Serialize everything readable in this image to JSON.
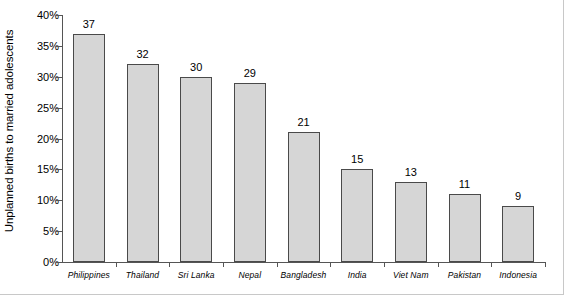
{
  "chart_data": {
    "type": "bar",
    "title": "",
    "xlabel": "",
    "ylabel": "Unplanned births to married adolescents",
    "ylim": [
      0,
      40
    ],
    "ytick_labels": [
      "0%",
      "5%",
      "10%",
      "15%",
      "20%",
      "25%",
      "30%",
      "35%",
      "40%"
    ],
    "ytick_values": [
      0,
      5,
      10,
      15,
      20,
      25,
      30,
      35,
      40
    ],
    "grid": false,
    "legend": "none",
    "bar_color": "#d6d6d6",
    "bar_border_color": "#4a4a4a",
    "axis_color": "#555555",
    "categories": [
      "Philippines",
      "Thailand",
      "Sri Lanka",
      "Nepal",
      "Bangladesh",
      "India",
      "Viet Nam",
      "Pakistan",
      "Indonesia"
    ],
    "values": [
      37,
      32,
      30,
      29,
      21,
      15,
      13,
      11,
      9
    ],
    "value_labels": [
      "37",
      "32",
      "30",
      "29",
      "21",
      "15",
      "13",
      "11",
      "9"
    ]
  }
}
